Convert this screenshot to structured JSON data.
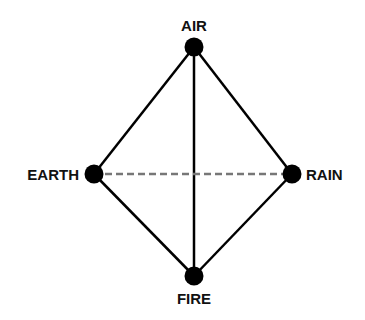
{
  "diagram": {
    "nodes": [
      {
        "id": "air",
        "label": "AIR",
        "x": 194,
        "y": 47
      },
      {
        "id": "earth",
        "label": "EARTH",
        "x": 94,
        "y": 174
      },
      {
        "id": "rain",
        "label": "RAIN",
        "x": 292,
        "y": 174
      },
      {
        "id": "fire",
        "label": "FIRE",
        "x": 194,
        "y": 276
      }
    ],
    "edges": [
      {
        "from": "air",
        "to": "earth",
        "style": "solid"
      },
      {
        "from": "air",
        "to": "rain",
        "style": "solid"
      },
      {
        "from": "air",
        "to": "fire",
        "style": "solid"
      },
      {
        "from": "earth",
        "to": "fire",
        "style": "solid"
      },
      {
        "from": "rain",
        "to": "fire",
        "style": "solid"
      },
      {
        "from": "earth",
        "to": "rain",
        "style": "dashed"
      }
    ],
    "colors": {
      "node": "#000000",
      "solid_edge": "#000000",
      "dashed_edge": "#777777",
      "background": "#ffffff"
    }
  }
}
